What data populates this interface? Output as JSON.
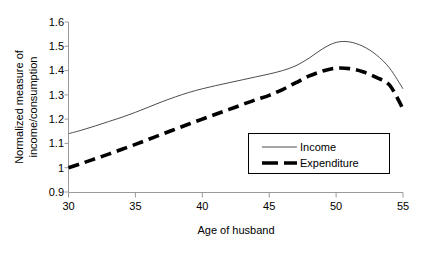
{
  "chart_data": {
    "type": "line",
    "title": "",
    "xlabel": "Age of husband",
    "ylabel": "Normalized measure of income/consumption",
    "ylabel_line1": "Normalized measure of",
    "ylabel_line2": "income/consumption",
    "xlim": [
      30,
      55
    ],
    "ylim": [
      0.9,
      1.6
    ],
    "xticks": [
      30,
      35,
      40,
      45,
      50,
      55
    ],
    "xtick_labels": [
      "30",
      "35",
      "40",
      "45",
      "50",
      "55"
    ],
    "yticks": [
      0.9,
      1.0,
      1.1,
      1.2,
      1.3,
      1.4,
      1.5,
      1.6
    ],
    "ytick_labels": [
      "0.9",
      "1",
      "1.1",
      "1.2",
      "1.3",
      "1.4",
      "1.5",
      "1.6"
    ],
    "grid": false,
    "legend_position": "lower-right-inside",
    "x": [
      30,
      31,
      32,
      33,
      34,
      35,
      36,
      37,
      38,
      39,
      40,
      41,
      42,
      43,
      44,
      45,
      46,
      47,
      48,
      49,
      50,
      51,
      52,
      53,
      54,
      55
    ],
    "series": [
      {
        "name": "Income",
        "style": "solid-thin",
        "color": "#4d4d4d",
        "values": [
          1.14,
          1.155,
          1.172,
          1.19,
          1.208,
          1.228,
          1.25,
          1.272,
          1.292,
          1.31,
          1.325,
          1.338,
          1.35,
          1.362,
          1.374,
          1.386,
          1.4,
          1.42,
          1.452,
          1.49,
          1.516,
          1.518,
          1.5,
          1.465,
          1.41,
          1.325
        ]
      },
      {
        "name": "Expenditure",
        "style": "dashed-thick",
        "color": "#000000",
        "values": [
          1.0,
          1.018,
          1.037,
          1.056,
          1.076,
          1.096,
          1.117,
          1.138,
          1.159,
          1.18,
          1.2,
          1.22,
          1.24,
          1.26,
          1.28,
          1.298,
          1.322,
          1.35,
          1.378,
          1.398,
          1.41,
          1.408,
          1.395,
          1.372,
          1.34,
          1.242
        ]
      }
    ]
  },
  "legend": {
    "items": [
      {
        "label": "Income"
      },
      {
        "label": "Expenditure"
      }
    ]
  }
}
